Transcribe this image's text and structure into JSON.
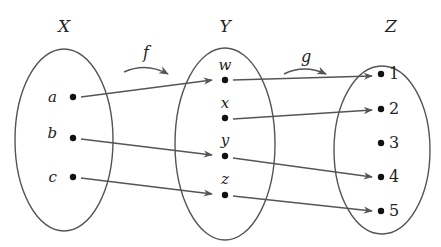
{
  "diagram": {
    "sets": [
      {
        "name": "X",
        "cx": 64,
        "cy": 140,
        "rx": 49,
        "ry": 91,
        "label_x": 64,
        "label_y": 32,
        "elements": [
          {
            "label": "a",
            "x": 73,
            "y": 97,
            "lx": 57,
            "ly": 102
          },
          {
            "label": "b",
            "x": 73,
            "y": 138,
            "lx": 57,
            "ly": 138
          },
          {
            "label": "c",
            "x": 73,
            "y": 177,
            "lx": 57,
            "ly": 182
          }
        ]
      },
      {
        "name": "Y",
        "cx": 225,
        "cy": 144,
        "rx": 50,
        "ry": 96,
        "label_x": 225,
        "label_y": 32,
        "elements": [
          {
            "label": "w",
            "x": 225,
            "y": 80,
            "lx": 225,
            "ly": 70
          },
          {
            "label": "x",
            "x": 225,
            "y": 118,
            "lx": 225,
            "ly": 108
          },
          {
            "label": "y",
            "x": 225,
            "y": 156,
            "lx": 225,
            "ly": 145
          },
          {
            "label": "z",
            "x": 225,
            "y": 195,
            "lx": 225,
            "ly": 184
          }
        ]
      },
      {
        "name": "Z",
        "cx": 382,
        "cy": 150,
        "rx": 48,
        "ry": 84,
        "label_x": 391,
        "label_y": 32,
        "elements": [
          {
            "label": "1",
            "x": 381,
            "y": 74,
            "lx": 389,
            "ly": 79
          },
          {
            "label": "2",
            "x": 381,
            "y": 109,
            "lx": 389,
            "ly": 114
          },
          {
            "label": "3",
            "x": 381,
            "y": 143,
            "lx": 389,
            "ly": 148
          },
          {
            "label": "4",
            "x": 381,
            "y": 177,
            "lx": 389,
            "ly": 182
          },
          {
            "label": "5",
            "x": 381,
            "y": 211,
            "lx": 389,
            "ly": 216
          }
        ]
      }
    ],
    "functions": [
      {
        "name": "f",
        "label_x": 146,
        "label_y": 58,
        "arc": "M124,72 Q146,62 168,74",
        "mappings": [
          [
            "a",
            "w"
          ],
          [
            "b",
            "y"
          ],
          [
            "c",
            "z"
          ]
        ]
      },
      {
        "name": "g",
        "label_x": 306,
        "label_y": 62,
        "arc": "M284,74 Q304,64 326,74",
        "mappings": [
          [
            "w",
            "1"
          ],
          [
            "x",
            "2"
          ],
          [
            "y",
            "4"
          ],
          [
            "z",
            "5"
          ]
        ]
      }
    ],
    "arrows": [
      {
        "from": "a",
        "to": "w",
        "x1": 81,
        "y1": 97,
        "x2": 212,
        "y2": 80
      },
      {
        "from": "b",
        "to": "y",
        "x1": 81,
        "y1": 139,
        "x2": 212,
        "y2": 155
      },
      {
        "from": "c",
        "to": "z",
        "x1": 81,
        "y1": 178,
        "x2": 212,
        "y2": 194
      },
      {
        "from": "w",
        "to": "1",
        "x1": 233,
        "y1": 80,
        "x2": 372,
        "y2": 76
      },
      {
        "from": "x",
        "to": "2",
        "x1": 233,
        "y1": 119,
        "x2": 372,
        "y2": 110
      },
      {
        "from": "y",
        "to": "4",
        "x1": 233,
        "y1": 158,
        "x2": 372,
        "y2": 177
      },
      {
        "from": "z",
        "to": "5",
        "x1": 233,
        "y1": 196,
        "x2": 372,
        "y2": 211
      }
    ],
    "colors": {
      "stroke": "#555555",
      "dot": "#111111",
      "text": "#222222"
    }
  }
}
